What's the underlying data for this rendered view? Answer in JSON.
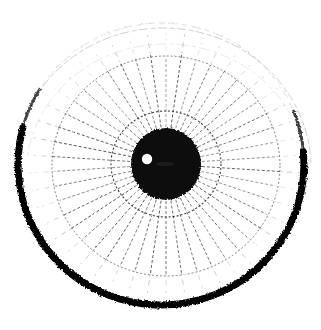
{
  "image": {
    "title": "Iris diagram",
    "description": "Black and white scanned line drawing of an eye iris: a large circle with a heavy dark rim that fades away at the top, dense radial fibre lines converging toward a solid black pupil, two faint concentric rings, and a small white specular highlight inside the pupil.",
    "width": 321,
    "height": 330,
    "style": "scanned halftone line art",
    "background_color": "#ffffff",
    "ink_color": "#000000"
  },
  "chart_data": {
    "type": "scatter",
    "xlabel": "",
    "ylabel": "",
    "center": {
      "x": 166,
      "y": 164
    },
    "rings": [
      {
        "name": "outer-halo-ring",
        "radius_x": 148,
        "radius_y": 140,
        "center_x": 163,
        "center_y": 168,
        "stroke": "#7a7a7a",
        "stroke_width": 0.8,
        "opacity": 0.45,
        "arc_start_deg": 182,
        "arc_end_deg": 358
      },
      {
        "name": "limbus-ring",
        "radius_x": 143,
        "radius_y": 141,
        "center_x": 161,
        "center_y": 164,
        "stroke": "#000000",
        "stroke_width": 7,
        "opacity": 1,
        "arc_start_deg": -5,
        "arc_end_deg": 195
      },
      {
        "name": "limbus-ring-faint-top",
        "radius_x": 143,
        "radius_y": 141,
        "center_x": 161,
        "center_y": 164,
        "stroke": "#9a9a9a",
        "stroke_width": 1,
        "opacity": 0.35,
        "arc_start_deg": 195,
        "arc_end_deg": 355
      },
      {
        "name": "collarette-outer-ring",
        "radius_x": 114,
        "radius_y": 110,
        "center_x": 166,
        "center_y": 166,
        "stroke": "#3a3a3a",
        "stroke_width": 0.9,
        "opacity": 0.7
      },
      {
        "name": "collarette-inner-ring",
        "radius_x": 55,
        "radius_y": 53,
        "center_x": 166,
        "center_y": 164,
        "stroke": "#1a1a1a",
        "stroke_width": 1.1,
        "opacity": 0.85
      }
    ],
    "spokes": {
      "count": 46,
      "inner_radius": 36,
      "outer_radius": 114,
      "stroke": "#222222",
      "stroke_width": 0.8,
      "dash": "3 2"
    },
    "pupil": {
      "center_x": 166,
      "center_y": 164,
      "radius_x": 35,
      "radius_y": 36,
      "fill": "#0a0a0a"
    },
    "highlight": {
      "center_x": 147,
      "center_y": 159,
      "radius": 5.2,
      "fill": "#ffffff"
    },
    "smudge": {
      "center_x": 165,
      "center_y": 164,
      "radius_x": 9,
      "radius_y": 2.2,
      "fill": "#2c2c2c",
      "opacity": 0.55
    }
  }
}
